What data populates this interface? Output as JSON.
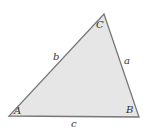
{
  "diagram": {
    "type": "triangle",
    "fill_color": "#e6e6e6",
    "stroke_color": "#777777",
    "vertices": [
      {
        "label": "A",
        "x": 9,
        "y": 116
      },
      {
        "label": "B",
        "x": 139,
        "y": 117
      },
      {
        "label": "C",
        "x": 104,
        "y": 14
      }
    ],
    "sides": [
      {
        "label": "a",
        "between": "B-C"
      },
      {
        "label": "b",
        "between": "A-C"
      },
      {
        "label": "c",
        "between": "A-B"
      }
    ]
  }
}
